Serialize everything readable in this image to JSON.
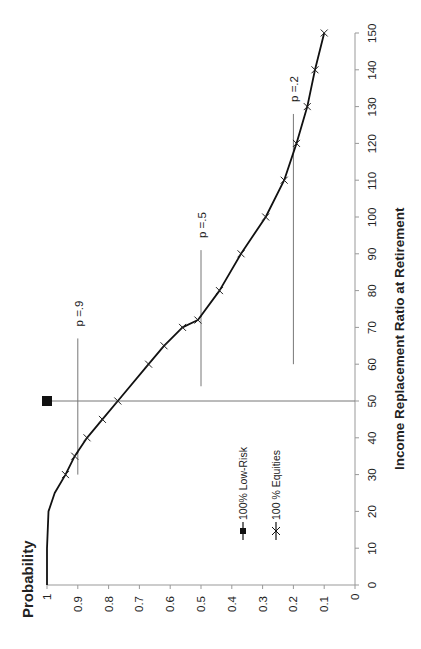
{
  "chart_data": {
    "type": "line",
    "orientation": "rotated-90-ccw",
    "title": "",
    "xlabel": "Income Replacement Ratio at Retirement",
    "ylabel": "Probability",
    "xlim": [
      0,
      150
    ],
    "ylim": [
      0,
      1
    ],
    "x_ticks": [
      0,
      10,
      20,
      30,
      40,
      50,
      60,
      70,
      80,
      90,
      100,
      110,
      120,
      130,
      140,
      150
    ],
    "y_ticks": [
      "1",
      "0.9",
      "0.8",
      "0.7",
      "0.6",
      "0.5",
      "0.4",
      "0.3",
      "0.2",
      "0.1",
      "0"
    ],
    "grid": false,
    "legend": {
      "position": "inside-lower-left",
      "entries": [
        "100% Low-Risk",
        "100 % Equities"
      ]
    },
    "series": [
      {
        "name": "100% Low-Risk",
        "marker": "square",
        "x": [
          50
        ],
        "y": [
          1.0
        ]
      },
      {
        "name": "100 % Equities",
        "marker": "x",
        "curve_x": [
          0,
          10,
          20,
          25,
          30,
          35,
          40,
          45,
          50,
          60,
          65,
          70,
          72,
          80,
          90,
          100,
          110,
          120,
          130,
          140,
          150
        ],
        "curve_y": [
          1.0,
          1.0,
          0.995,
          0.975,
          0.94,
          0.91,
          0.87,
          0.82,
          0.77,
          0.67,
          0.62,
          0.56,
          0.51,
          0.44,
          0.37,
          0.29,
          0.23,
          0.19,
          0.155,
          0.13,
          0.1
        ],
        "x": [
          30,
          35,
          40,
          45,
          50,
          60,
          65,
          70,
          72,
          80,
          90,
          100,
          110,
          120,
          130,
          140,
          150
        ],
        "y": [
          0.94,
          0.91,
          0.87,
          0.82,
          0.77,
          0.67,
          0.62,
          0.56,
          0.51,
          0.44,
          0.37,
          0.29,
          0.23,
          0.19,
          0.155,
          0.13,
          0.1
        ]
      }
    ],
    "annotations": [
      {
        "label": "p =.9",
        "prob": 0.9,
        "x_from": 30,
        "x_to": 67
      },
      {
        "label": "p =.5",
        "prob": 0.5,
        "x_from": 54,
        "x_to": 91
      },
      {
        "label": "p =.2",
        "prob": 0.2,
        "x_from": 60,
        "x_to": 128
      }
    ],
    "reference_lines": [
      {
        "type": "vertical-income",
        "income": 50,
        "label": "Low-Risk income level"
      }
    ]
  },
  "labels": {
    "ylabel": "Probability",
    "xlabel": "Income Replacement Ratio at Retirement",
    "legend_low_risk": "100% Low-Risk",
    "legend_equities": "100 % Equities"
  }
}
